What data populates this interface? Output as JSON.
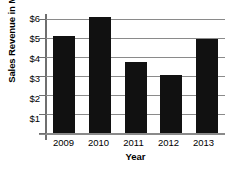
{
  "chart_data": {
    "type": "bar",
    "title": "",
    "subtitle": "",
    "xlabel": "Year",
    "ylabel": "Sales Revenue in Millions",
    "categories": [
      "2009",
      "2010",
      "2011",
      "2012",
      "2013"
    ],
    "values": [
      5.1,
      6.1,
      3.75,
      3.05,
      4.95
    ],
    "series": [
      {
        "name": "Sales Revenue",
        "values": [
          5.1,
          6.1,
          3.75,
          3.05,
          4.95
        ],
        "color": "#111111"
      }
    ],
    "ylim": [
      0,
      6.45
    ],
    "xlim": [
      0,
      5
    ],
    "y_ticks": [
      1,
      2,
      3,
      4,
      5,
      6
    ],
    "y_tick_labels": [
      "$1",
      "$2",
      "$3",
      "$4",
      "$5",
      "$6"
    ],
    "x_tick_labels": [
      "2009",
      "2010",
      "2011",
      "2012",
      "2013"
    ],
    "grid": true,
    "grid_axis": "y",
    "grid_color": "#8a8a8a",
    "legend": false,
    "legend_position": "none",
    "bar_color": "#111111",
    "background_color": "#ffffff",
    "annotations": []
  },
  "axis": {
    "y_title": "Sales Revenue in Millions",
    "x_title": "Year",
    "y_labels": [
      "$6",
      "$5",
      "$4",
      "$3",
      "$2",
      "$1"
    ],
    "x_labels": [
      "2009",
      "2010",
      "2011",
      "2012",
      "2013"
    ]
  }
}
